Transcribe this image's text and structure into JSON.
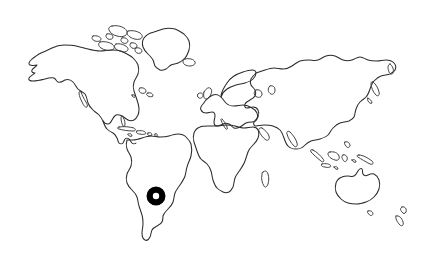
{
  "figure": {
    "type": "world-map-outline",
    "title": "World map outline with single location marker",
    "background_color": "#ffffff",
    "outline_color": "#2b2b2b",
    "width_px": 434,
    "height_px": 253,
    "labels": [],
    "legend": [],
    "axis_labels": []
  },
  "map": {
    "projection_style": "flat-rectangular",
    "regions": [
      {
        "id": "north-america",
        "name": "North America"
      },
      {
        "id": "greenland",
        "name": "Greenland"
      },
      {
        "id": "iceland",
        "name": "Iceland"
      },
      {
        "id": "arctic-islands",
        "name": "Canadian Arctic Islands"
      },
      {
        "id": "central-america",
        "name": "Central America"
      },
      {
        "id": "caribbean",
        "name": "Caribbean Islands"
      },
      {
        "id": "south-america",
        "name": "South America"
      },
      {
        "id": "europe",
        "name": "Europe"
      },
      {
        "id": "british-isles",
        "name": "British Isles"
      },
      {
        "id": "africa",
        "name": "Africa"
      },
      {
        "id": "madagascar",
        "name": "Madagascar"
      },
      {
        "id": "asia",
        "name": "Asia"
      },
      {
        "id": "japan",
        "name": "Japan"
      },
      {
        "id": "indonesia",
        "name": "Indonesian Archipelago"
      },
      {
        "id": "new-guinea",
        "name": "New Guinea"
      },
      {
        "id": "australia",
        "name": "Australia"
      },
      {
        "id": "tasmania",
        "name": "Tasmania"
      },
      {
        "id": "new-zealand",
        "name": "New Zealand"
      }
    ]
  },
  "marker": {
    "shape": "ring",
    "color": "#000000",
    "center_x": 156,
    "center_y": 196,
    "outer_radius": 9.5,
    "inner_radius": 3.2,
    "stroke_width": 6.3,
    "located_over": "south-america",
    "label": ""
  },
  "chart_data": {
    "type": "scatter",
    "title": "World map outline with single location marker",
    "xlabel": "",
    "ylabel": "",
    "xlim": [
      0,
      434
    ],
    "ylim": [
      253,
      0
    ],
    "grid": false,
    "legend_position": "none",
    "series": [
      {
        "name": "location marker",
        "marker": "ring",
        "color": "#000000",
        "points": [
          {
            "x": 156,
            "y": 196
          }
        ]
      }
    ],
    "annotations": []
  }
}
